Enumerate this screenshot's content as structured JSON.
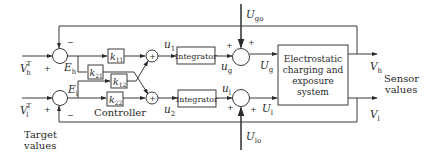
{
  "diagram": {
    "type": "block-diagram",
    "inputs": {
      "vh_target": {
        "base": "V",
        "sup": "T",
        "sub": "h"
      },
      "vl_target": {
        "base": "V",
        "sup": "T",
        "sub": "l"
      },
      "caption_line1": "Target",
      "caption_line2": "values"
    },
    "errors": {
      "eh": {
        "base": "E",
        "sub": "h"
      },
      "el": {
        "base": "E",
        "sub": "l"
      }
    },
    "gains": {
      "k11": {
        "base": "k",
        "sub": "11"
      },
      "k21": {
        "base": "k",
        "sub": "21"
      },
      "k12": {
        "base": "k",
        "sub": "12"
      },
      "k22": {
        "base": "k",
        "sub": "22"
      }
    },
    "controller_label": "Controller",
    "signals": {
      "u1": {
        "base": "u",
        "sub": "1"
      },
      "u2": {
        "base": "u",
        "sub": "2"
      },
      "ug": {
        "base": "u",
        "sub": "g"
      },
      "ul": {
        "base": "u",
        "sub": "l"
      },
      "Ug": {
        "base": "U",
        "sub": "g"
      },
      "Ul": {
        "base": "U",
        "sub": "l"
      },
      "Ugo": {
        "base": "U",
        "sub": "go"
      },
      "Ulo": {
        "base": "U",
        "sub": "lo"
      }
    },
    "integrator_label": "Integrator",
    "plant": {
      "line1": "Electrostatic",
      "line2": "charging and",
      "line3": "exposure",
      "line4": "system"
    },
    "outputs": {
      "vh": {
        "base": "V",
        "sub": "h"
      },
      "vl": {
        "base": "V",
        "sub": "l"
      },
      "caption_line1": "Sensor",
      "caption_line2": "values"
    },
    "signs": {
      "plus": "+",
      "minus": "−"
    }
  }
}
